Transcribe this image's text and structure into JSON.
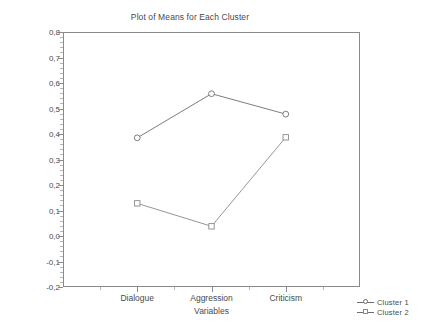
{
  "chart_data": {
    "type": "line",
    "title": "Plot of Means for Each Cluster",
    "xlabel": "Variables",
    "ylabel": "",
    "categories": [
      "Dialogue",
      "Aggression",
      "Criticism"
    ],
    "series": [
      {
        "name": "Cluster  1",
        "marker": "circle",
        "color": "#6e6e6e",
        "values": [
          0.385,
          0.558,
          0.478
        ]
      },
      {
        "name": "Cluster  2",
        "marker": "square",
        "color": "#8a8a8a",
        "values": [
          0.128,
          0.038,
          0.387
        ]
      }
    ],
    "ylim": [
      -0.2,
      0.8
    ],
    "ytick_labels": [
      "0,8",
      "0,7",
      "0,6",
      "0,5",
      "0,4",
      "0,3",
      "0,2",
      "0,1",
      "0,0",
      "-0,1",
      "-0,2"
    ],
    "ytick_values": [
      0.8,
      0.7,
      0.6,
      0.5,
      0.4,
      0.3,
      0.2,
      0.1,
      0.0,
      -0.1,
      -0.2
    ],
    "grid": false,
    "legend_position": "bottom-right",
    "legend_entries": [
      "Cluster  1",
      "Cluster  2"
    ]
  },
  "axis": {
    "y_ticks": [
      {
        "label": "0,8",
        "value": 0.8
      },
      {
        "label": "0,7",
        "value": 0.7
      },
      {
        "label": "0,6",
        "value": 0.6
      },
      {
        "label": "0,5",
        "value": 0.5
      },
      {
        "label": "0,4",
        "value": 0.4
      },
      {
        "label": "0,3",
        "value": 0.3
      },
      {
        "label": "0,2",
        "value": 0.2
      },
      {
        "label": "0,1",
        "value": 0.1
      },
      {
        "label": "0,0",
        "value": 0.0
      },
      {
        "label": "-0,1",
        "value": -0.1
      },
      {
        "label": "-0,2",
        "value": -0.2
      }
    ],
    "x_ticks": [
      {
        "label": "Dialogue",
        "value": 1
      },
      {
        "label": "Aggression",
        "value": 2
      },
      {
        "label": "Criticism",
        "value": 3
      }
    ],
    "x_title": "Variables"
  },
  "legend": {
    "items": [
      {
        "label": "Cluster  1",
        "marker": "circle"
      },
      {
        "label": "Cluster  2",
        "marker": "square"
      }
    ]
  },
  "caption": ""
}
